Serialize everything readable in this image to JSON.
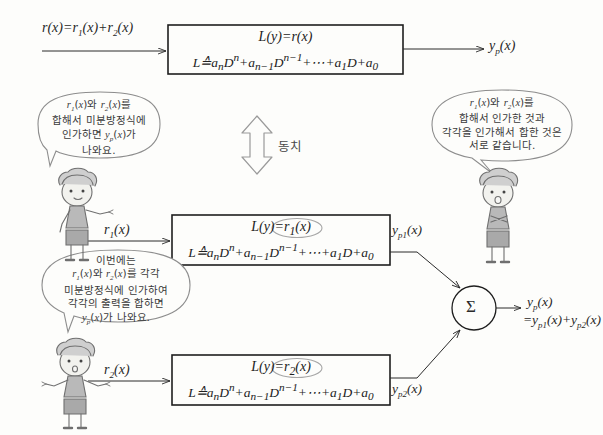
{
  "figure": {
    "equivalence_label": "동치"
  },
  "blocks": [
    {
      "id": "block-top",
      "input_label": "r(x)=r₁(x)+r₂(x)",
      "eq_line1_lhs": "L(y)=",
      "eq_line1_rhs": "r(x)",
      "eq_line2": "L ≜ aₙDⁿ + aₙ₋₁Dⁿ⁻¹ + ⋯ + a₁D + a₀",
      "output_label": "y_p(x)",
      "highlighted": false
    },
    {
      "id": "block-middle",
      "input_label": "r₁(x)",
      "eq_line1_lhs": "L(y)=",
      "eq_line1_rhs": "r₁(x)",
      "eq_line2": "L ≜ aₙDⁿ + aₙ₋₁Dⁿ⁻¹ + ⋯ + a₁D + a₀",
      "output_label": "y_p1(x)",
      "highlighted": true
    },
    {
      "id": "block-bottom",
      "input_label": "r₂(x)",
      "eq_line1_lhs": "L(y)=",
      "eq_line1_rhs": "r₂(x)",
      "eq_line2": "L ≜ aₙDⁿ + aₙ₋₁Dⁿ⁻¹ + ⋯ + a₁D + a₀",
      "output_label": "y_p2(x)",
      "highlighted": true
    }
  ],
  "summer": {
    "symbol": "Σ",
    "output_line1": "y_p(x)",
    "output_line2": "=y_p1(x)+y_p2(x)"
  },
  "bubbles": [
    {
      "id": "bubble-top-left",
      "lines": [
        "r₁(x)와 r₂(x)를",
        "합해서 미분방정식에",
        "인가하면 y_p(x)가",
        "나와요."
      ]
    },
    {
      "id": "bubble-top-right",
      "lines": [
        "r₁(x)와 r₂(x)를",
        "합해서 인가한 것과",
        "각각을 인가해서 합한 것은",
        "서로 같습니다."
      ]
    },
    {
      "id": "bubble-bottom-left",
      "lines": [
        "이번에는",
        "r₁(x)와 r₂(x)를 각각",
        "미분방정식에 인가하여",
        "각각의 출력을 합하면",
        "y_p(x)가 나와요."
      ]
    }
  ],
  "characters": [
    {
      "id": "character-upper-left",
      "pose": "pointing-right"
    },
    {
      "id": "character-right",
      "pose": "arms-crossed"
    },
    {
      "id": "character-lower-left",
      "pose": "arms-out"
    }
  ],
  "colors": {
    "background": "#fdfdfb",
    "ink": "#2b2b2b",
    "bubble_stroke": "#8d8d8d",
    "character_fill": "#b9b9b9",
    "arrow_hollow_stroke": "#9a9a9a"
  }
}
